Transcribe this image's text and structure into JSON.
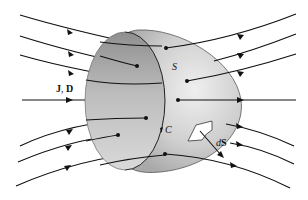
{
  "figure": {
    "labels": {
      "field": "J, D",
      "field_J": "J",
      "field_sep": ", ",
      "field_D": "D",
      "surface": "S",
      "contour": "C",
      "area_element_d": "d",
      "area_element_S": "S"
    },
    "colors": {
      "line": "#111111",
      "surface_light": "#e6e6e6",
      "surface_mid": "#b8b8b8",
      "surface_dark": "#8c8c8c",
      "background": "#ffffff"
    },
    "field_line_count": 9
  }
}
